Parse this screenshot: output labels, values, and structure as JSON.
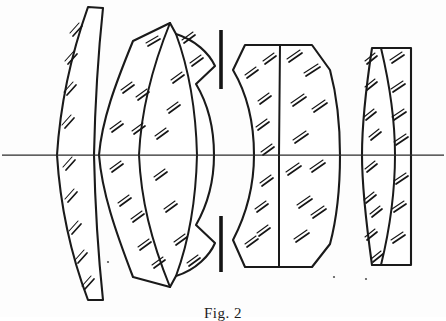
{
  "figure": {
    "caption": "Fig. 2",
    "caption_clipped": true,
    "background_color": "#ffffff",
    "ink_color": "#1a1a1a",
    "width": 446,
    "height": 317,
    "optical_axis": {
      "label": "optical-axis",
      "y": 155,
      "x_start": 2,
      "x_end": 444,
      "color": "#2b2b2b"
    },
    "aperture_stop": {
      "label": "aperture stop",
      "x": 221,
      "color": "#141414",
      "upper_bar": {
        "y_top": 30,
        "y_bottom": 89
      },
      "lower_bar": {
        "y_top": 216,
        "y_bottom": 272
      }
    },
    "elements": [
      {
        "id": "L1",
        "name": "element-1",
        "type": "meniscus singlet",
        "cemented": false,
        "x_left": 55,
        "x_right": 104,
        "y_top": 6,
        "y_bottom": 301,
        "hatched": true
      },
      {
        "id": "L2",
        "name": "element-2",
        "type": "cemented meniscus doublet",
        "cemented": true,
        "x_left": 98,
        "x_right": 216,
        "y_top": 22,
        "y_bottom": 287,
        "hatched": true
      },
      {
        "id": "L3",
        "name": "element-3",
        "type": "cemented biconvex doublet",
        "cemented": true,
        "x_left": 232,
        "x_right": 340,
        "y_top": 45,
        "y_bottom": 268,
        "hatched": true
      },
      {
        "id": "L4",
        "name": "element-4",
        "type": "cemented doublet, plano rear face",
        "cemented": true,
        "x_left": 361,
        "x_right": 411,
        "y_top": 48,
        "y_bottom": 265,
        "hatched": true
      }
    ],
    "element_count": 4,
    "hatching_style": "short double diagonal strokes (glass section hatching)",
    "drawing_type": "patent line drawing, monochrome"
  }
}
